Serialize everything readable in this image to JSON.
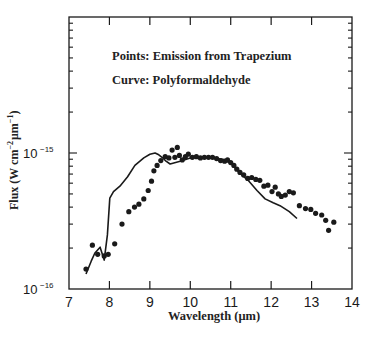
{
  "chart_data": {
    "type": "scatter",
    "title": "",
    "annotations": [
      "Points: Emission from Trapezium",
      "Curve: Polyformaldehyde"
    ],
    "xlabel": "Wavelength (μm)",
    "ylabel": "Flux (W cm⁻² μm⁻¹)",
    "xlim": [
      7,
      14
    ],
    "ylim": [
      1e-16,
      1e-14
    ],
    "yscale": "log",
    "x_ticks": [
      7,
      8,
      9,
      10,
      11,
      12,
      13,
      14
    ],
    "y_tick_labels": [
      {
        "base": "10",
        "exp": "−16",
        "value": 1e-16
      },
      {
        "base": "10",
        "exp": "−15",
        "value": 1e-15
      }
    ],
    "grid": false,
    "legend_position": "upper-left (text annotations)",
    "series": [
      {
        "name": "Emission from Trapezium",
        "kind": "points",
        "x": [
          7.42,
          7.58,
          7.71,
          7.87,
          7.97,
          8.13,
          8.31,
          8.48,
          8.62,
          8.73,
          8.85,
          8.96,
          9.04,
          9.1,
          9.18,
          9.27,
          9.38,
          9.47,
          9.55,
          9.62,
          9.68,
          9.73,
          9.8,
          9.88,
          9.95,
          10.05,
          10.15,
          10.25,
          10.35,
          10.45,
          10.55,
          10.65,
          10.75,
          10.85,
          10.92,
          11.0,
          11.08,
          11.15,
          11.23,
          11.32,
          11.42,
          11.52,
          11.62,
          11.72,
          11.82,
          11.92,
          12.02,
          12.1,
          12.18,
          12.25,
          12.35,
          12.45,
          12.55,
          12.7,
          12.85,
          12.98,
          13.1,
          13.25,
          13.35,
          13.42,
          13.55
        ],
        "y": [
          1.4e-16,
          2.1e-16,
          1.8e-16,
          1.75e-16,
          1.8e-16,
          2.15e-16,
          3e-16,
          3.7e-16,
          4e-16,
          4.2e-16,
          4.6e-16,
          5.3e-16,
          6.2e-16,
          7.4e-16,
          8.1e-16,
          8.8e-16,
          9.4e-16,
          9.2e-16,
          1.05e-15,
          9.3e-16,
          1.1e-15,
          9.6e-16,
          8.9e-16,
          9.4e-16,
          9.8e-16,
          9.3e-16,
          9.4e-16,
          9.2e-16,
          9.3e-16,
          9.3e-16,
          9.3e-16,
          9.1e-16,
          8.8e-16,
          8.7e-16,
          8.9e-16,
          8.5e-16,
          8.1e-16,
          7.6e-16,
          7.2e-16,
          6.9e-16,
          6.5e-16,
          6.6e-16,
          6.4e-16,
          6.3e-16,
          5.7e-16,
          5.8e-16,
          5.2e-16,
          5.6e-16,
          5e-16,
          4.8e-16,
          4.9e-16,
          5.2e-16,
          5.1e-16,
          4.1e-16,
          3.9e-16,
          3.85e-16,
          3.6e-16,
          3.5e-16,
          3.2e-16,
          2.7e-16,
          3.1e-16
        ]
      },
      {
        "name": "Polyformaldehyde",
        "kind": "curve",
        "x": [
          7.42,
          7.55,
          7.64,
          7.77,
          7.87,
          7.95,
          8.01,
          8.1,
          8.26,
          8.45,
          8.63,
          8.85,
          9.0,
          9.13,
          9.22,
          9.3,
          9.4,
          9.5,
          9.75,
          10.0,
          10.25,
          10.5,
          10.8,
          11.0,
          11.1,
          11.25,
          11.43,
          11.65,
          11.85,
          12.05,
          12.22,
          12.45,
          12.64
        ],
        "y": [
          1.29e-16,
          1.6e-16,
          1.84e-16,
          2.03e-16,
          1.63e-16,
          2.5e-16,
          4.66e-16,
          5.2e-16,
          5.7e-16,
          6.7e-16,
          8.1e-16,
          9.2e-16,
          9.8e-16,
          1e-15,
          9.7e-16,
          9.3e-16,
          8.7e-16,
          8.3e-16,
          8.7e-16,
          9.2e-16,
          9.3e-16,
          9.2e-16,
          9e-16,
          8.4e-16,
          7.8e-16,
          7e-16,
          6.3e-16,
          5.3e-16,
          4.6e-16,
          4.3e-16,
          4.1e-16,
          3.7e-16,
          3.3e-16
        ]
      }
    ]
  },
  "plot_area": {
    "left": 69,
    "top": 17,
    "right": 352,
    "bottom": 289
  },
  "labels": {
    "annotation_points": "Points: Emission from Trapezium",
    "annotation_curve": "Curve: Polyformaldehyde",
    "x_axis": "Wavelength (μm)",
    "y_axis_prefix": "Flux (W cm",
    "y_axis_sup1": "−2",
    "y_axis_mid": "μm",
    "y_axis_sup2": "−1",
    "y_axis_suffix": ")"
  },
  "colors": {
    "ink": "#1a1a1a",
    "background": "#ffffff"
  }
}
